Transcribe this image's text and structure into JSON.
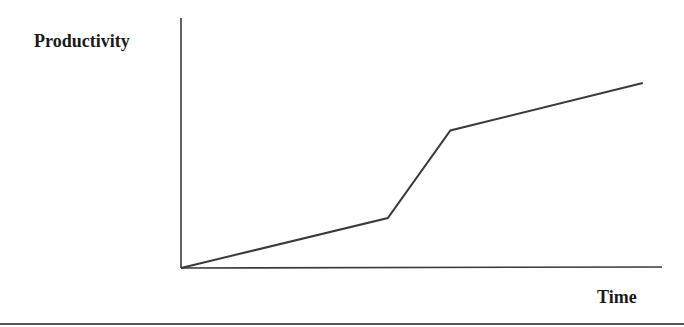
{
  "chart_data": {
    "type": "line",
    "title": "",
    "xlabel": "Time",
    "ylabel": "Productivity",
    "x_ticks": [],
    "y_ticks": [],
    "xlim": [
      0,
      10
    ],
    "ylim": [
      0,
      10
    ],
    "grid": false,
    "legend": null,
    "series": [
      {
        "name": "Productivity over time",
        "x": [
          0,
          4.3,
          5.6,
          9.6
        ],
        "y": [
          0,
          2.0,
          5.5,
          7.4
        ],
        "color": "#3a3a3a"
      }
    ],
    "note": "Conceptual chart without numeric tick marks; values are relative estimates on a 0-10 scale."
  },
  "colors": {
    "line": "#3a3a3a",
    "axis": "#3a3a3a",
    "separator": "#555555",
    "text": "#1a1a1a",
    "background": "#ffffff"
  }
}
